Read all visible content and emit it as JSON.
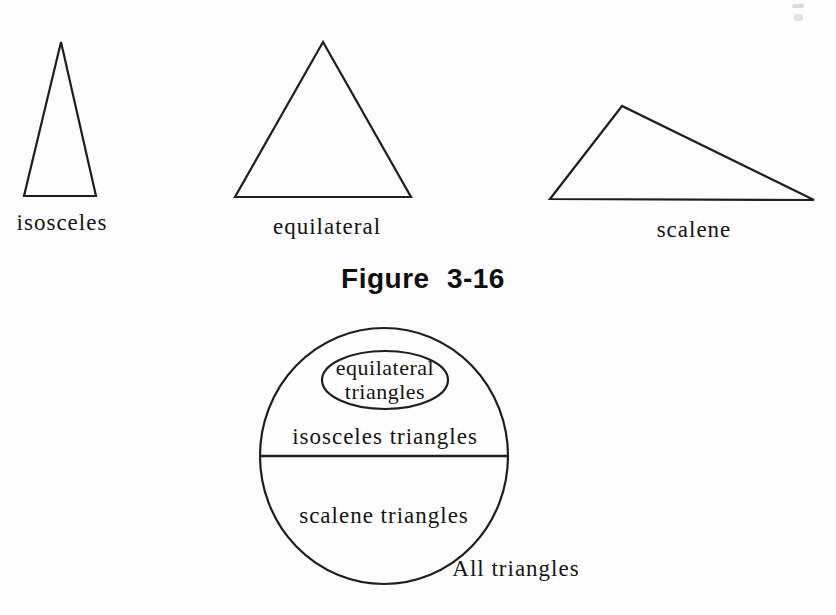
{
  "colors": {
    "ink": "#1e1e1e",
    "background": "#fdfdfd"
  },
  "triangle_row": {
    "items": [
      {
        "label": "isosceles"
      },
      {
        "label": "equilateral"
      },
      {
        "label": "scalene"
      }
    ]
  },
  "caption": {
    "text": "Figure 3-16"
  },
  "venn": {
    "inner": {
      "line1": "equilateral",
      "line2": "triangles"
    },
    "upper_label": "isosceles triangles",
    "lower_label": "scalene triangles",
    "outer_label": "All triangles"
  }
}
